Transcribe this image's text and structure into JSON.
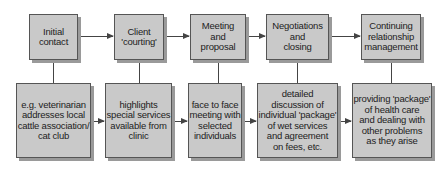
{
  "diagram": {
    "type": "flowchart",
    "stages": [
      {
        "label": "Initial\ncontact",
        "detail": "e.g. veterinarian\naddresses local\ncattle association/\ncat club"
      },
      {
        "label": "Client\n'courting'",
        "detail": "highlights\nspecial services\navailable from\nclinic"
      },
      {
        "label": "Meeting\nand\nproposal",
        "detail": "face to face\nmeeting with\nselected\nindividuals"
      },
      {
        "label": "Negotiations\nand\nclosing",
        "detail": "detailed\ndiscussion of\nindividual 'package'\nof wet services\nand agreement\non fees, etc."
      },
      {
        "label": "Continuing\nrelationship\nmanagement",
        "detail": "providing 'package'\nof health care\nand dealing with\nother problems\nas they arise"
      }
    ],
    "colors": {
      "box_fill": "#c9c9c9",
      "box_border": "#555555",
      "shadow": "#9a9a9a",
      "line": "#444444"
    }
  }
}
